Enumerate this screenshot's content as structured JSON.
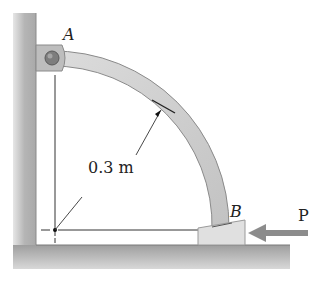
{
  "diagram": {
    "type": "statics-mechanics-figure",
    "labels": {
      "point_a": "A",
      "point_b": "B",
      "radius": "0.3 m",
      "force": "P"
    },
    "colors": {
      "wall": "#b8b8b8",
      "wall_shadow": "#d6d6d6",
      "bar_fill": "#cfcfcf",
      "bar_edge": "#8a8a8a",
      "block_fill": "#dedede",
      "arrow": "#8c8c8c",
      "line": "#333333",
      "text": "#222222"
    },
    "geometry": {
      "arc_center": [
        55,
        230
      ],
      "arc_inner_radius": 160,
      "arc_outer_radius": 174,
      "pin_a": [
        52,
        58
      ],
      "block_b": {
        "x": 198,
        "y": 222,
        "w": 47,
        "h": 23
      }
    }
  }
}
